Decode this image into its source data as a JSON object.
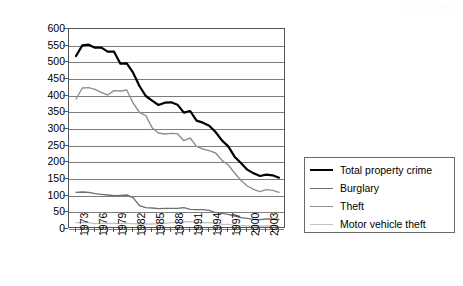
{
  "scan_artifact_text": "Section 2.5",
  "chart_data": {
    "type": "line",
    "title": "",
    "xlabel": "",
    "ylabel": "Victimization Rate per 1,000 Households",
    "ylim": [
      0,
      600
    ],
    "ytick_step": 50,
    "yticks": [
      600,
      550,
      500,
      450,
      400,
      350,
      300,
      250,
      200,
      150,
      100,
      50,
      0
    ],
    "grid": true,
    "legend_position": "right",
    "x": [
      1973,
      1974,
      1975,
      1976,
      1977,
      1978,
      1979,
      1980,
      1981,
      1982,
      1983,
      1984,
      1985,
      1986,
      1987,
      1988,
      1989,
      1990,
      1991,
      1992,
      1993,
      1994,
      1995,
      1996,
      1997,
      1998,
      1999,
      2000,
      2001,
      2002,
      2003,
      2004,
      2005
    ],
    "xtick_labels": [
      "1973",
      "",
      "",
      "1976",
      "",
      "",
      "1979",
      "",
      "",
      "1982",
      "",
      "",
      "1985",
      "",
      "",
      "1988",
      "",
      "",
      "1991",
      "",
      "",
      "1994",
      "",
      "",
      "1997",
      "",
      "",
      "2000",
      "",
      "",
      "2003",
      "",
      ""
    ],
    "series": [
      {
        "name": "Total property crime",
        "color": "#000000",
        "width": 2.2,
        "values": [
          519,
          551,
          553,
          544,
          544,
          532,
          532,
          496,
          497,
          469,
          429,
          399,
          385,
          372,
          379,
          380,
          373,
          349,
          354,
          325,
          319,
          310,
          291,
          266,
          248,
          217,
          198,
          178,
          167,
          159,
          163,
          161,
          154
        ]
      },
      {
        "name": "Burglary",
        "color": "#6f6f6f",
        "width": 1.4,
        "values": [
          110,
          111,
          110,
          106,
          104,
          102,
          100,
          101,
          102,
          94,
          70,
          64,
          63,
          61,
          62,
          62,
          62,
          64,
          59,
          58,
          58,
          56,
          49,
          47,
          44,
          39,
          34,
          32,
          29,
          28,
          30,
          30,
          29
        ]
      },
      {
        "name": "Theft",
        "color": "#8f8f8f",
        "width": 1.4,
        "values": [
          390,
          423,
          424,
          419,
          410,
          402,
          415,
          414,
          417,
          378,
          350,
          340,
          304,
          288,
          285,
          287,
          286,
          265,
          273,
          248,
          240,
          235,
          228,
          206,
          192,
          168,
          146,
          129,
          119,
          112,
          118,
          116,
          110
        ]
      },
      {
        "name": "Motor vehicle theft",
        "color": "#c2c2c2",
        "width": 1.4,
        "values": [
          19,
          19,
          19,
          16,
          17,
          17,
          17,
          17,
          17,
          16,
          15,
          15,
          15,
          16,
          17,
          19,
          20,
          21,
          22,
          19,
          19,
          19,
          17,
          14,
          14,
          11,
          10,
          9,
          9,
          9,
          9,
          9,
          8
        ]
      }
    ]
  },
  "legend": {
    "items": [
      {
        "label": "Total property crime",
        "color": "#000000",
        "width": "2.4px"
      },
      {
        "label": "Burglary",
        "color": "#6f6f6f",
        "width": "1.6px"
      },
      {
        "label": "Theft",
        "color": "#8f8f8f",
        "width": "1.6px"
      },
      {
        "label": "Motor vehicle theft",
        "color": "#c2c2c2",
        "width": "1.6px"
      }
    ]
  }
}
